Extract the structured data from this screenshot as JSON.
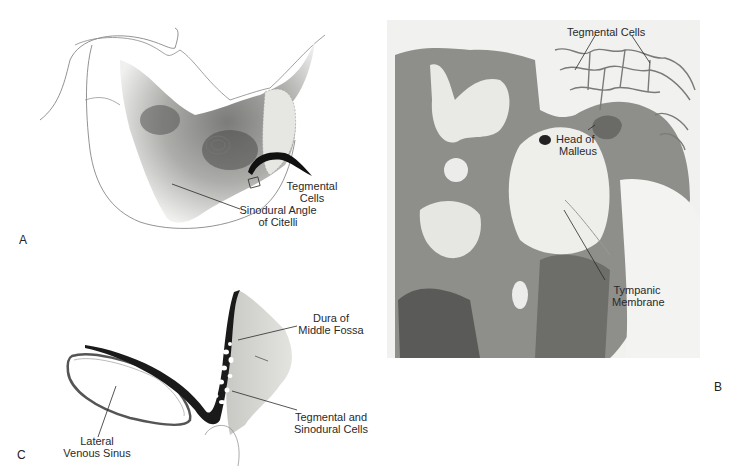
{
  "figure": {
    "panels": [
      {
        "id": "A",
        "letter": "A",
        "type": "illustration",
        "labels": {
          "tegmental_cells_line1": "Tegmental",
          "tegmental_cells_line2": "Cells",
          "sinodural_line1": "Sinodural Angle",
          "sinodural_line2": "of Citelli"
        }
      },
      {
        "id": "B",
        "letter": "B",
        "type": "histology-section",
        "labels": {
          "tegmental_cells": "Tegmental Cells",
          "head_of_malleus_line1": "Head of",
          "head_of_malleus_line2": "Malleus",
          "tympanic_line1": "Tympanic",
          "tympanic_line2": "Membrane"
        }
      },
      {
        "id": "C",
        "letter": "C",
        "type": "illustration",
        "labels": {
          "dura_line1": "Dura of",
          "dura_line2": "Middle Fossa",
          "tegmental_sinodural_line1": "Tegmental and",
          "tegmental_sinodural_line2": "Sinodural Cells",
          "lateral_line1": "Lateral",
          "lateral_line2": "Venous Sinus"
        }
      }
    ],
    "colors": {
      "line": "#2a2a2a",
      "tissue_dark": "#5a5a5a",
      "tissue_mid": "#8a8a88",
      "tissue_light": "#b5b5b2",
      "background": "#ffffff"
    }
  }
}
